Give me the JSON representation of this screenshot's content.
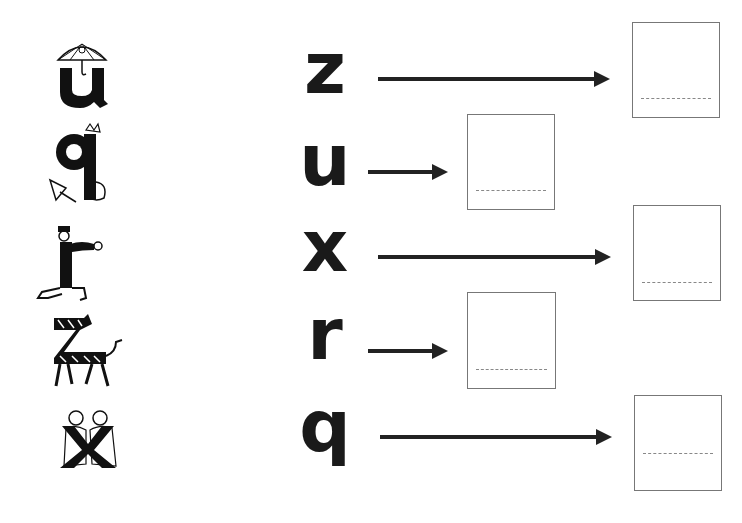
{
  "worksheet": {
    "pictures": [
      {
        "letter": "u",
        "illustration": "umbrella-u-icon"
      },
      {
        "letter": "q",
        "illustration": "queen-q-icon"
      },
      {
        "letter": "r",
        "illustration": "runner-r-icon"
      },
      {
        "letter": "z",
        "illustration": "zebra-z-icon"
      },
      {
        "letter": "x",
        "illustration": "kissing-x-icon"
      }
    ],
    "rows": [
      {
        "letter": "z",
        "arrow": "long",
        "answer": ""
      },
      {
        "letter": "u",
        "arrow": "short",
        "answer": ""
      },
      {
        "letter": "x",
        "arrow": "long",
        "answer": ""
      },
      {
        "letter": "r",
        "arrow": "short",
        "answer": ""
      },
      {
        "letter": "q",
        "arrow": "long",
        "answer": ""
      }
    ]
  },
  "colors": {
    "ink": "#1a1a1a",
    "box_border": "#777777",
    "dash": "#888888"
  }
}
